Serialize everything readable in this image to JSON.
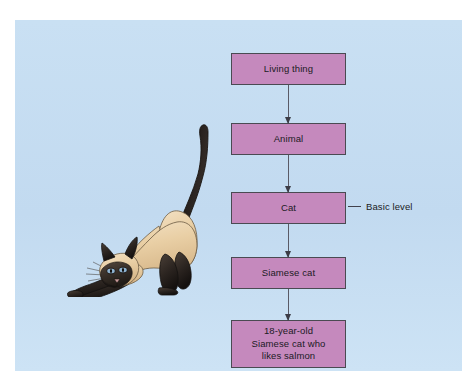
{
  "figure": {
    "panel_background": "#c5ddf2",
    "box_fill": "#c589bd",
    "box_border": "#4a4a52",
    "connector_color": "#5a5a66",
    "text_color": "#1b1b24"
  },
  "hierarchy": {
    "nodes": [
      {
        "id": "living-thing",
        "label": "Living thing"
      },
      {
        "id": "animal",
        "label": "Animal"
      },
      {
        "id": "cat",
        "label": "Cat"
      },
      {
        "id": "siamese-cat",
        "label": "Siamese cat"
      },
      {
        "id": "specific-cat",
        "label": "18-year-old\nSiamese cat who\nlikes salmon"
      }
    ],
    "connector_count": 4
  },
  "annotation": {
    "basic_level_label": "Basic level",
    "points_to": "cat"
  },
  "illustration": {
    "name": "siamese-cat-stretching",
    "body_color": "#e8cfa8",
    "point_color": "#2e2620",
    "eye_color": "#7fa8c9"
  }
}
